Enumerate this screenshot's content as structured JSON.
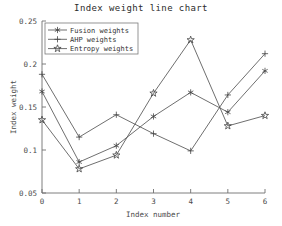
{
  "chart_data": {
    "type": "line",
    "title": "Index weight line chart",
    "xlabel": "Index number",
    "ylabel": "Index weight",
    "x": [
      0,
      1,
      2,
      3,
      4,
      5,
      6
    ],
    "xticklabels": [
      "0",
      "1",
      "2",
      "3",
      "4",
      "5",
      "6"
    ],
    "yticklabels": [
      "0.05",
      "0.1",
      "0.15",
      "0.2",
      "0.25"
    ],
    "yticks": [
      0.05,
      0.1,
      0.15,
      0.2,
      0.25
    ],
    "xlim": [
      0,
      6
    ],
    "ylim": [
      0.05,
      0.25
    ],
    "grid": false,
    "legend_position": "top-left",
    "series": [
      {
        "name": "Fusion weights",
        "marker": "asterisk",
        "color": "#555555",
        "values": [
          0.168,
          0.086,
          0.105,
          0.139,
          0.167,
          0.144,
          0.192
        ]
      },
      {
        "name": "AHP weights",
        "marker": "plus",
        "color": "#555555",
        "values": [
          0.188,
          0.115,
          0.141,
          0.119,
          0.099,
          0.164,
          0.212
        ]
      },
      {
        "name": "Entropy weights",
        "marker": "star",
        "color": "#555555",
        "values": [
          0.135,
          0.078,
          0.094,
          0.166,
          0.228,
          0.128,
          0.14
        ]
      }
    ]
  },
  "legend": {
    "items": [
      {
        "label": "Fusion weights",
        "marker": "asterisk-marker"
      },
      {
        "label": "AHP weights",
        "marker": "plus-marker"
      },
      {
        "label": "Entropy weights",
        "marker": "star-marker"
      }
    ]
  }
}
